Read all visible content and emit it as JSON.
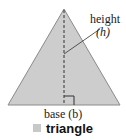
{
  "figure": {
    "shape": "triangle",
    "colors": {
      "fill": "#cdcdcd",
      "stroke": "#8a8a8a",
      "line": "#333333"
    },
    "labels": {
      "height_word": "height",
      "height_var": "(h)",
      "base": "base (b)"
    }
  },
  "caption": {
    "swatch_color": "#c8c8c8",
    "text": "triangle"
  }
}
